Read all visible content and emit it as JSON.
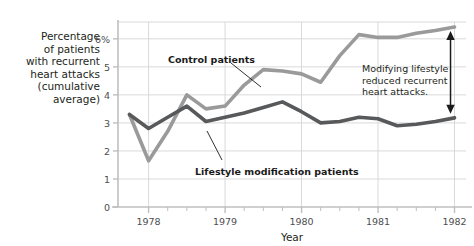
{
  "chart_data": {
    "type": "line",
    "title": "",
    "xlabel": "Year",
    "ylabel": "Percentage of patients with recurrent heart attacks (cumulative average)",
    "xlim": [
      1977.6,
      1982.15
    ],
    "ylim": [
      0,
      6.6
    ],
    "grid": true,
    "legend_position": "inline-annotations",
    "ytick_labels": [
      "0",
      "1",
      "2",
      "3",
      "4",
      "5",
      "6%"
    ],
    "ytick_values": [
      0,
      1,
      2,
      3,
      4,
      5,
      6
    ],
    "xtick_labels": [
      "1978",
      "1979",
      "1980",
      "1981",
      "1982"
    ],
    "xtick_values": [
      1978,
      1979,
      1980,
      1981,
      1982
    ],
    "x": [
      1977.75,
      1978.0,
      1978.25,
      1978.5,
      1978.75,
      1979.0,
      1979.25,
      1979.5,
      1979.75,
      1980.0,
      1980.25,
      1980.5,
      1980.75,
      1981.0,
      1981.25,
      1981.5,
      1981.75,
      1982.0
    ],
    "series": [
      {
        "name": "Control patients",
        "color": "#9a9a9a",
        "values": [
          3.3,
          1.65,
          2.7,
          4.0,
          3.5,
          3.6,
          4.35,
          4.9,
          4.85,
          4.75,
          4.45,
          5.4,
          6.15,
          6.05,
          6.05,
          6.2,
          6.3,
          6.42
        ]
      },
      {
        "name": "Lifestyle modification patients",
        "color": "#58595b",
        "values": [
          3.3,
          2.8,
          3.2,
          3.6,
          3.05,
          3.2,
          3.35,
          3.55,
          3.75,
          3.4,
          3.0,
          3.05,
          3.2,
          3.15,
          2.9,
          2.95,
          3.05,
          3.18
        ]
      }
    ],
    "annotations": [
      {
        "name": "control-patients-label",
        "text": "Control patients",
        "x": 168,
        "y": 54
      },
      {
        "name": "lifestyle-patients-label",
        "text": "Lifestyle modification patients",
        "x": 195,
        "y": 166
      },
      {
        "name": "gap-annotation",
        "text": "Modifying lifestyle\nreduced recurrent\nheart attacks.",
        "x": 362,
        "y": 63
      }
    ]
  },
  "axis_titles": {
    "y": "Percentage\nof patients\nwith recurrent\nheart attacks\n(cumulative\naverage)",
    "x": "Year"
  },
  "colors": {
    "control_line": "#9a9a9a",
    "lifestyle_line": "#58595b",
    "grid": "#d9d9d9",
    "axis": "#bfbfbf",
    "text": "#231f20",
    "tick_text": "#4d4d4f",
    "arrow": "#1a1a1a",
    "background": "#ffffff"
  }
}
